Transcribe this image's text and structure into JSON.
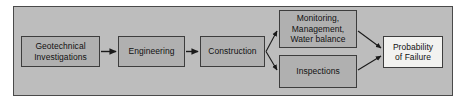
{
  "diagram": {
    "type": "flowchart",
    "orientation": "left-to-right",
    "colors": {
      "panel_background": "#bdbdbd",
      "panel_border": "#4a4a4a",
      "node_fill": "#b0b0b0",
      "node_fill_light": "#f2f2f0",
      "node_border": "#3d3d3d",
      "connector": "#1a1a1a",
      "text": "#111111",
      "page_background": "#ffffff"
    },
    "nodes": [
      {
        "id": "geotechnical",
        "lines": [
          "Geotechnical",
          "Investigations"
        ],
        "style": "gray"
      },
      {
        "id": "engineering",
        "lines": [
          "Engineering"
        ],
        "style": "gray"
      },
      {
        "id": "construction",
        "lines": [
          "Construction"
        ],
        "style": "gray"
      },
      {
        "id": "monitoring",
        "lines": [
          "Monitoring,",
          "Management,",
          "Water balance"
        ],
        "style": "gray"
      },
      {
        "id": "inspections",
        "lines": [
          "Inspections"
        ],
        "style": "gray"
      },
      {
        "id": "probability",
        "lines": [
          "Probability",
          "of Failure"
        ],
        "style": "light"
      }
    ],
    "edges": [
      {
        "from": "geotechnical",
        "to": "engineering",
        "style": "straight-arrow"
      },
      {
        "from": "engineering",
        "to": "construction",
        "style": "straight-arrow"
      },
      {
        "from": "construction",
        "to": "monitoring",
        "style": "branch-up-arrow"
      },
      {
        "from": "construction",
        "to": "inspections",
        "style": "branch-down-arrow"
      },
      {
        "from": "monitoring",
        "to": "probability",
        "style": "merge-down-arrow"
      },
      {
        "from": "inspections",
        "to": "probability",
        "style": "merge-up-arrow"
      }
    ]
  }
}
